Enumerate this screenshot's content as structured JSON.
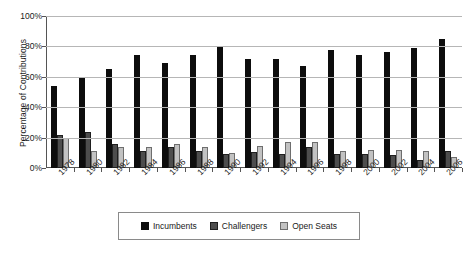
{
  "chart_data": {
    "type": "bar",
    "title": "",
    "xlabel": "",
    "ylabel": "Percentage of Contributions",
    "ylim": [
      0,
      100
    ],
    "yticks": [
      "0%",
      "20%",
      "40%",
      "60%",
      "80%",
      "100%"
    ],
    "ytick_values": [
      0,
      20,
      40,
      60,
      80,
      100
    ],
    "grid": true,
    "legend_position": "bottom",
    "categories": [
      "1978",
      "1980",
      "1982",
      "1984",
      "1986",
      "1988",
      "1990",
      "1992",
      "1994",
      "1996",
      "1998",
      "2000",
      "2002",
      "2004",
      "2006"
    ],
    "series": [
      {
        "name": "Incumbents",
        "color": "#0d0d0d",
        "values": [
          54,
          60,
          65,
          74.5,
          69,
          74.5,
          80,
          72,
          72,
          67,
          77.5,
          74.5,
          76,
          79,
          85
        ]
      },
      {
        "name": "Challengers",
        "color": "#4d4d4d",
        "values": [
          22,
          24,
          16,
          11,
          13.5,
          11,
          9,
          10.5,
          9,
          13.5,
          9,
          9,
          8.5,
          5,
          11
        ]
      },
      {
        "name": "Open Seats",
        "color": "#c2c2c2",
        "values": [
          20,
          11,
          13.5,
          13.5,
          16,
          13.5,
          10,
          14.5,
          17,
          17,
          11,
          12,
          12,
          11.5,
          7
        ]
      }
    ]
  },
  "legend": {
    "items": [
      {
        "label": "Incumbents"
      },
      {
        "label": "Challengers"
      },
      {
        "label": "Open Seats"
      }
    ]
  }
}
